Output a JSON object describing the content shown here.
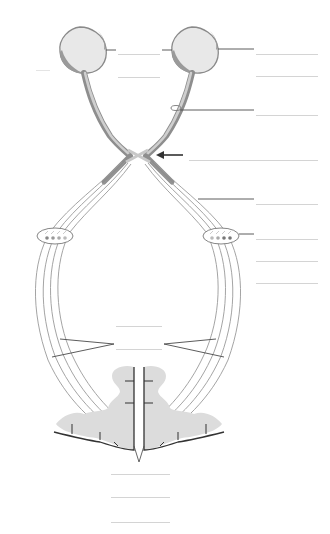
{
  "diagram": {
    "title": "",
    "colors": {
      "background": "#ffffff",
      "eye_fill": "#e6e6e6",
      "eye_rim": "#8a8a8a",
      "nerve_dark": "#8e8e8e",
      "nerve_light": "#c8c8c8",
      "fiber": "#9a9a9a",
      "cortex_fill": "#dcdcdc",
      "cortex_edge": "#3a3a3a",
      "leader": "#4a4a4a",
      "blank_line": "#d4d4d4",
      "arrow": "#333333"
    },
    "labels": [
      {
        "id": "label-1",
        "text": "",
        "x": 256,
        "y": 49,
        "w": 62
      },
      {
        "id": "label-2",
        "text": "",
        "x": 256,
        "y": 71,
        "w": 62
      },
      {
        "id": "label-3",
        "text": "",
        "x": 256,
        "y": 110,
        "w": 62
      },
      {
        "id": "label-4",
        "text": "",
        "x": 189,
        "y": 155,
        "w": 129
      },
      {
        "id": "label-5",
        "text": "",
        "x": 256,
        "y": 199,
        "w": 62
      },
      {
        "id": "label-6",
        "text": "",
        "x": 256,
        "y": 234,
        "w": 62
      },
      {
        "id": "label-7",
        "text": "",
        "x": 256,
        "y": 256,
        "w": 62
      },
      {
        "id": "label-8",
        "text": "",
        "x": 256,
        "y": 278,
        "w": 62
      },
      {
        "id": "label-9",
        "text": "",
        "x": 118,
        "y": 49,
        "w": 42
      },
      {
        "id": "label-10",
        "text": "",
        "x": 118,
        "y": 72,
        "w": 42
      },
      {
        "id": "label-11",
        "text": "",
        "x": 36,
        "y": 65,
        "w": 14
      },
      {
        "id": "label-12",
        "text": "",
        "x": 116,
        "y": 321,
        "w": 46
      },
      {
        "id": "label-13",
        "text": "",
        "x": 116,
        "y": 344,
        "w": 46
      },
      {
        "id": "label-14",
        "text": "",
        "x": 111,
        "y": 469,
        "w": 59
      },
      {
        "id": "label-15",
        "text": "",
        "x": 111,
        "y": 492,
        "w": 59
      },
      {
        "id": "label-16",
        "text": "",
        "x": 111,
        "y": 517,
        "w": 59
      }
    ]
  }
}
